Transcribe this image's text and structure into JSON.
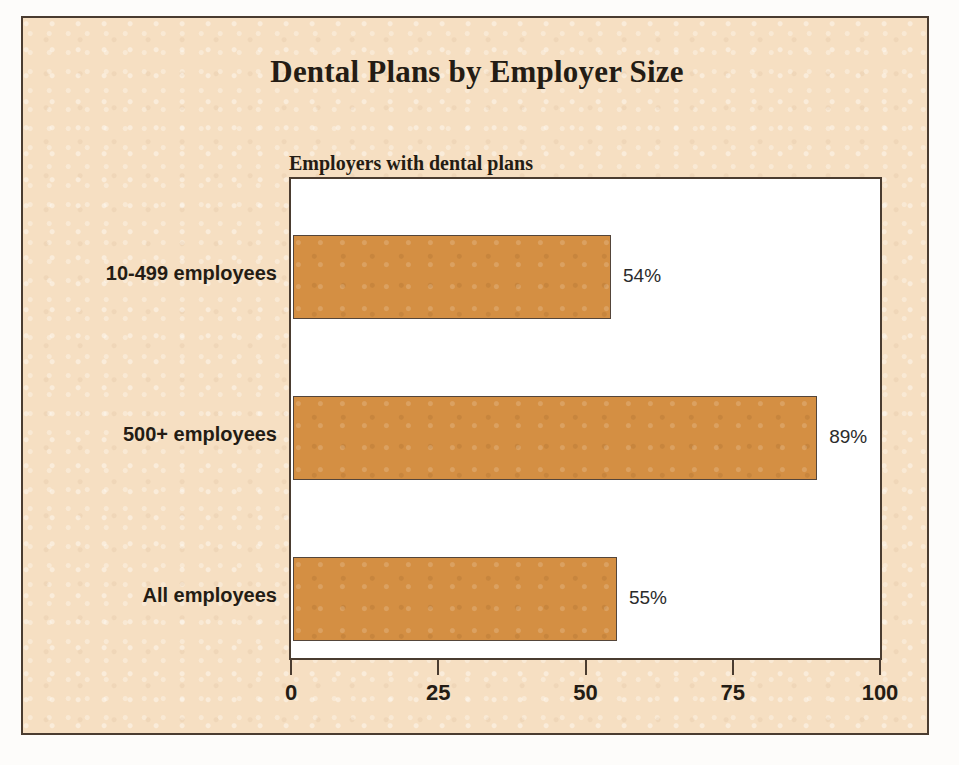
{
  "chart_data": {
    "type": "bar",
    "orientation": "horizontal",
    "title": "Dental Plans by Employer Size",
    "subtitle": "Employers with dental plans",
    "categories": [
      "10-499 employees",
      "500+ employees",
      "All employees"
    ],
    "values": [
      54,
      89,
      55
    ],
    "value_labels": [
      "54%",
      "89%",
      "55%"
    ],
    "xlabel": "",
    "ylabel": "",
    "xlim": [
      0,
      100
    ],
    "xticks": [
      0,
      25,
      50,
      75,
      100
    ],
    "xtick_labels": [
      "0",
      "25",
      "50",
      "75",
      "100"
    ],
    "grid": false,
    "legend": null,
    "colors": {
      "bar_fill": "#d48f43",
      "bar_edge": "#54453a",
      "panel_background": "#f6dfc2",
      "plot_background": "#ffffff",
      "frame": "#4a3c30",
      "text": "#241c14"
    }
  }
}
